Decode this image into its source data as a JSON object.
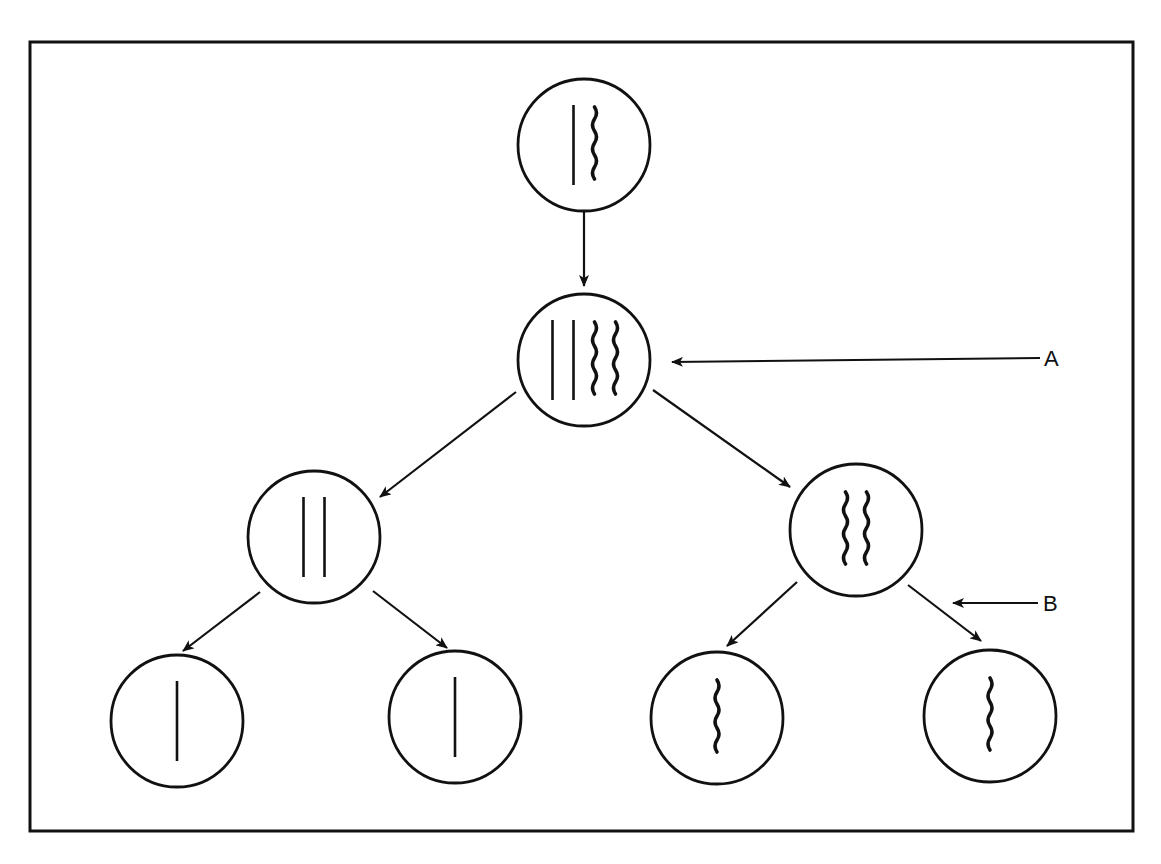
{
  "diagram": {
    "type": "cell-division-tree",
    "frame": {
      "x": 30,
      "y": 42,
      "width": 1103,
      "height": 789
    },
    "stroke_color": "#111111",
    "background": "#ffffff",
    "nodes": [
      {
        "id": "parent-cell",
        "cx": 584,
        "cy": 145,
        "r": 66,
        "chromosomes": [
          "straight",
          "wavy"
        ]
      },
      {
        "id": "replicated-cell",
        "cx": 584,
        "cy": 360,
        "r": 66,
        "chromosomes": [
          "straight",
          "straight",
          "wavy",
          "wavy"
        ]
      },
      {
        "id": "daughter-cell-left",
        "cx": 314,
        "cy": 537,
        "r": 66,
        "chromosomes": [
          "straight",
          "straight"
        ]
      },
      {
        "id": "daughter-cell-right",
        "cx": 856,
        "cy": 530,
        "r": 66,
        "chromosomes": [
          "wavy",
          "wavy"
        ]
      },
      {
        "id": "gamete-1",
        "cx": 177,
        "cy": 721,
        "r": 66,
        "chromosomes": [
          "straight"
        ]
      },
      {
        "id": "gamete-2",
        "cx": 455,
        "cy": 717,
        "r": 66,
        "chromosomes": [
          "straight"
        ]
      },
      {
        "id": "gamete-3",
        "cx": 717,
        "cy": 718,
        "r": 66,
        "chromosomes": [
          "wavy"
        ]
      },
      {
        "id": "gamete-4",
        "cx": 990,
        "cy": 716,
        "r": 66,
        "chromosomes": [
          "wavy"
        ]
      }
    ],
    "edges": [
      {
        "from": "parent-cell",
        "to": "replicated-cell",
        "x1": 584,
        "y1": 212,
        "x2": 584,
        "y2": 286
      },
      {
        "from": "replicated-cell",
        "to": "daughter-cell-left",
        "x1": 516,
        "y1": 392,
        "x2": 380,
        "y2": 497
      },
      {
        "from": "replicated-cell",
        "to": "daughter-cell-right",
        "x1": 653,
        "y1": 390,
        "x2": 790,
        "y2": 487
      },
      {
        "from": "daughter-cell-left",
        "to": "gamete-1",
        "x1": 260,
        "y1": 592,
        "x2": 183,
        "y2": 651
      },
      {
        "from": "daughter-cell-left",
        "to": "gamete-2",
        "x1": 373,
        "y1": 591,
        "x2": 447,
        "y2": 648
      },
      {
        "from": "daughter-cell-right",
        "to": "gamete-3",
        "x1": 797,
        "y1": 582,
        "x2": 727,
        "y2": 646
      },
      {
        "from": "daughter-cell-right",
        "to": "gamete-4",
        "x1": 908,
        "y1": 585,
        "x2": 981,
        "y2": 641
      }
    ],
    "pointers": [
      {
        "label": "A",
        "x1": 1040,
        "y1": 358,
        "x2": 672,
        "y2": 362,
        "label_x": 1044,
        "label_y": 366
      },
      {
        "label": "B",
        "x1": 1038,
        "y1": 603,
        "x2": 953,
        "y2": 603,
        "label_x": 1043,
        "label_y": 611
      }
    ]
  }
}
